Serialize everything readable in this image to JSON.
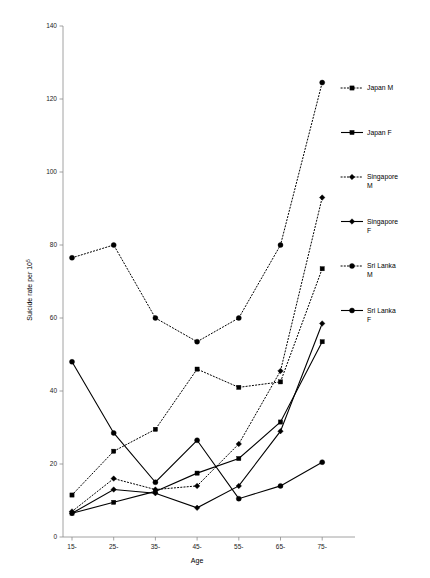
{
  "chart_data": {
    "type": "line",
    "title": "",
    "xlabel": "Age",
    "ylabel": "Suicide rate per 10",
    "ylabel_superscript": "5",
    "categories": [
      "15-",
      "25-",
      "35-",
      "45-",
      "55-",
      "65-",
      "75-"
    ],
    "ylim": [
      0,
      140
    ],
    "yticks": [
      0,
      20,
      40,
      60,
      80,
      100,
      120,
      140
    ],
    "grid": false,
    "legend_position": "right",
    "series": [
      {
        "name": "Japan M",
        "style": "dotted",
        "marker": "square",
        "values": [
          11.5,
          23.5,
          29.5,
          46,
          41,
          42.5,
          73.5
        ]
      },
      {
        "name": "Japan F",
        "style": "solid",
        "marker": "square",
        "values": [
          6.5,
          9.5,
          12.5,
          17.5,
          21.5,
          31.5,
          53.5
        ]
      },
      {
        "name": "Singapore M",
        "style": "dotted",
        "marker": "diamond",
        "values": [
          7,
          16,
          13,
          14,
          25.5,
          45.5,
          93
        ]
      },
      {
        "name": "Singapore F",
        "style": "solid",
        "marker": "diamond",
        "values": [
          6.5,
          13,
          12,
          8,
          14,
          29,
          58.5
        ]
      },
      {
        "name": "Sri Lanka M",
        "style": "dotted",
        "marker": "circle",
        "values": [
          76.5,
          80,
          60,
          53.5,
          60,
          80,
          124.5
        ]
      },
      {
        "name": "Sri Lanka F",
        "style": "solid",
        "marker": "circle",
        "values": [
          48,
          28.5,
          15,
          26.5,
          10.5,
          14,
          20.5
        ]
      }
    ]
  },
  "legend": {
    "entries": [
      {
        "label": "Japan M"
      },
      {
        "label": "Japan F"
      },
      {
        "label": "Singapore M"
      },
      {
        "label": "Singapore F"
      },
      {
        "label": "Sri Lanka M"
      },
      {
        "label": "Sri Lanka F"
      }
    ]
  }
}
